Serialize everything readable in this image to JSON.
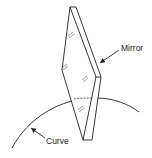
{
  "diagram": {
    "labels": {
      "mirror": "Mirror",
      "curve": "Curve"
    },
    "colors": {
      "line": "#222222",
      "background": "#ffffff"
    }
  }
}
